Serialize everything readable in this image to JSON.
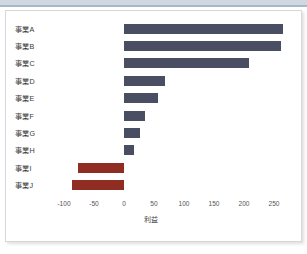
{
  "chart_data": {
    "type": "bar",
    "orientation": "horizontal",
    "title": "",
    "xlabel": "利益",
    "ylabel": "",
    "categories": [
      "事業A",
      "事業B",
      "事業C",
      "事業D",
      "事業E",
      "事業F",
      "事業G",
      "事業H",
      "事業I",
      "事業J"
    ],
    "values": [
      265,
      262,
      208,
      68,
      57,
      35,
      27,
      17,
      -77,
      -87
    ],
    "xlim": [
      -120,
      285
    ],
    "xticks": [
      -100,
      -50,
      0,
      50,
      100,
      150,
      200,
      250
    ],
    "xticklabels": [
      "-100",
      "-50",
      "0",
      "50",
      "100",
      "150",
      "200",
      "250"
    ],
    "grid": false,
    "legend": false,
    "colors": {
      "positive": "#4a4e63",
      "negative": "#8f2d22",
      "plot_background": "#ffffff",
      "frame_border": "#d8d8d8",
      "top_band": "#cfd8e0",
      "tick_text": "#555555",
      "label_text": "#3a3a3a"
    }
  }
}
